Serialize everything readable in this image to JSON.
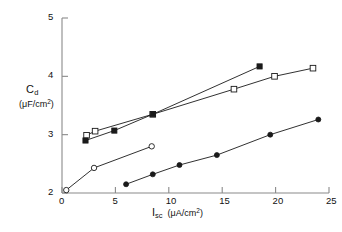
{
  "chart_data": {
    "type": "scatter",
    "title": "",
    "xlabel": "I_sc (μA/cm²)",
    "ylabel": "C_d (μF/cm²)",
    "xlabel_symbol": "I",
    "xlabel_sub": "sc",
    "xlabel_units": "(μA/cm",
    "xlabel_units_sup": "2",
    "xlabel_units_end": ")",
    "ylabel_symbol": "C",
    "ylabel_sub": "d",
    "ylabel_units": "(μF/cm",
    "ylabel_units_sup": "2",
    "ylabel_units_end": ")",
    "xlim": [
      0,
      25
    ],
    "ylim": [
      2,
      5
    ],
    "xticks": [
      0,
      5,
      10,
      15,
      20,
      25
    ],
    "yticks": [
      2,
      3,
      4,
      5
    ],
    "xtick_labels": [
      "0",
      "5",
      "10",
      "15",
      "20",
      "25"
    ],
    "ytick_labels": [
      "2",
      "3",
      "4",
      "5"
    ],
    "grid": false,
    "legend": "none",
    "axis_color": "#8a8a8a",
    "line_color": "#1a1a1a",
    "marker_fill": "#1a1a1a",
    "marker_open": "#ffffff",
    "series": [
      {
        "name": "open-squares-upper",
        "marker": "open-square",
        "x": [
          2.3,
          3.1,
          8.5,
          16.1,
          19.9,
          23.5
        ],
        "y": [
          2.99,
          3.06,
          3.35,
          3.78,
          4.0,
          4.14
        ]
      },
      {
        "name": "filled-squares-upper",
        "marker": "filled-square",
        "x": [
          2.2,
          4.9,
          8.5,
          18.5
        ],
        "y": [
          2.9,
          3.07,
          3.35,
          4.17
        ]
      },
      {
        "name": "open-circles-lower",
        "marker": "open-circle",
        "x": [
          0.4,
          3.0,
          8.4
        ],
        "y": [
          2.05,
          2.43,
          2.8
        ]
      },
      {
        "name": "filled-circles-lower",
        "marker": "filled-circle",
        "x": [
          6.0,
          8.5,
          11.0,
          14.5,
          19.5,
          24.0
        ],
        "y": [
          2.15,
          2.32,
          2.48,
          2.65,
          3.0,
          3.26
        ]
      }
    ]
  },
  "axes": {
    "x_tick_labels": [
      "0",
      "5",
      "10",
      "15",
      "20",
      "25"
    ],
    "y_tick_labels": [
      "2",
      "3",
      "4",
      "5"
    ]
  }
}
